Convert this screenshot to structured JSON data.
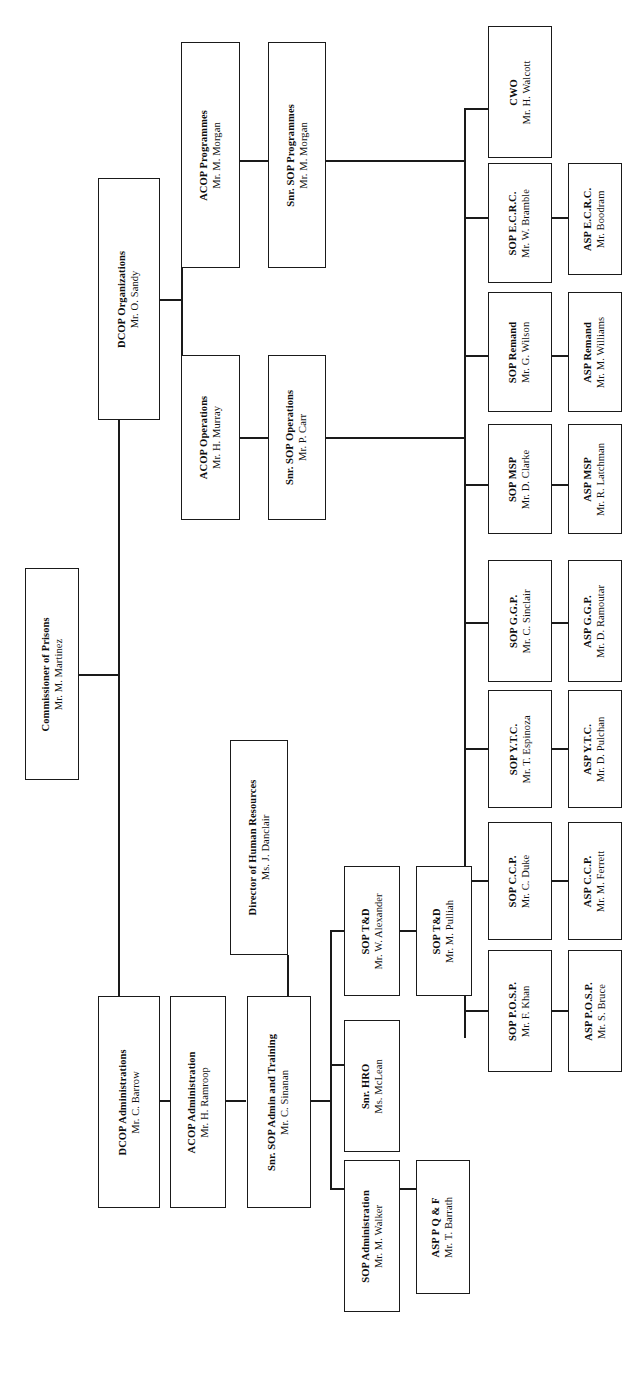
{
  "document": {
    "kind": "organizational-chart",
    "orientation": "landscape-rotated",
    "line_color": "#1a1a1a",
    "box_fill": "#ffffff",
    "page_background": "#ffffff"
  },
  "nodes": {
    "commissioner": {
      "title": "Commissioner of Prisons",
      "person": "Mr. M. Martinez"
    },
    "dcop_organizations": {
      "title": "DCOP Organizations",
      "person": "Mr. O. Sandy"
    },
    "acop_programmes": {
      "title": "ACOP Programmes",
      "person": "Mr. M. Morgan"
    },
    "snr_sop_programmes": {
      "title": "Snr. SOP Programmes",
      "person": "Mr. M. Morgan"
    },
    "acop_operations": {
      "title": "ACOP Operations",
      "person": "Mr. H. Murray"
    },
    "snr_sop_operations": {
      "title": "Snr. SOP Operations",
      "person": "Mr. P. Carr"
    },
    "cwo": {
      "title": "CWO",
      "person": "Mr. H. Walcott"
    },
    "sop_ecrc": {
      "title": "SOP E.C.R.C.",
      "person": "Mr. W. Bramble"
    },
    "asp_ecrc": {
      "title": "ASP E.C.R.C.",
      "person": "Mr. Boodram"
    },
    "sop_remand": {
      "title": "SOP Remand",
      "person": "Mr. G. Wilson"
    },
    "asp_remand": {
      "title": "ASP Remand",
      "person": "Mr. M. Williams"
    },
    "sop_msp": {
      "title": "SOP MSP",
      "person": "Mr. D. Clarke"
    },
    "asp_msp": {
      "title": "ASP MSP",
      "person": "Mr. R. Latchman"
    },
    "sop_ggp": {
      "title": "SOP G.G.P.",
      "person": "Mr. C. Sinclair"
    },
    "asp_ggp": {
      "title": "ASP G.G.P.",
      "person": "Mr. D. Ramoutar"
    },
    "sop_ytc": {
      "title": "SOP Y.T.C.",
      "person": "Mr. T. Espinoza"
    },
    "asp_ytc": {
      "title": "ASP Y.T.C.",
      "person": "Mr. D. Pulchan"
    },
    "sop_ccp": {
      "title": "SOP C.C.P.",
      "person": "Mr. C. Duke"
    },
    "asp_ccp": {
      "title": "ASP C.C.P.",
      "person": "Mr. M. Ferrett"
    },
    "sop_posp": {
      "title": "SOP P.O.S.P.",
      "person": "Mr. F. Khan"
    },
    "asp_posp": {
      "title": "ASP P.O.S.P.",
      "person": "Mr. S. Bruce"
    },
    "dcop_administrations": {
      "title": "DCOP Administrations",
      "person": "Mr. C. Barrow"
    },
    "acop_administration": {
      "title": "ACOP Administration",
      "person": "Mr. H. Ramroop"
    },
    "director_hr": {
      "title": "Director of Human Resources",
      "person": "Ms. J. Danclair"
    },
    "snr_sop_admin_train": {
      "title": "Snr. SOP Admin and Training",
      "person": "Mr. C. Sinanan"
    },
    "snr_hro": {
      "title": "Snr. HRO",
      "person": "Ms. McLean"
    },
    "sop_td_alexander": {
      "title": "SOP T&D",
      "person": "Mr. W. Alexander"
    },
    "sop_td_pulliah": {
      "title": "SOP T&D",
      "person": "Mr. M. Pulliah"
    },
    "sop_administration": {
      "title": "SOP Administration",
      "person": "Mr. M. Walker"
    },
    "asp_pqf": {
      "title": "ASP P Q & F",
      "person": "Mr. T. Barrath"
    }
  }
}
